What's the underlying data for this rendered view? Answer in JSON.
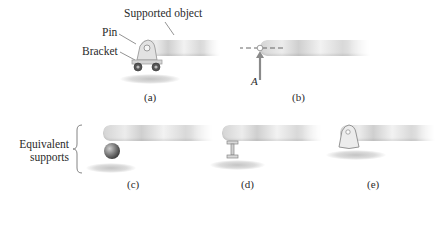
{
  "figure": {
    "panel_a": {
      "labels": {
        "supported_object": "Supported object",
        "pin": "Pin",
        "bracket": "Bracket"
      },
      "caption": "(a)"
    },
    "panel_b": {
      "force_label": "A",
      "caption": "(b)"
    },
    "group_label": {
      "line1": "Equivalent",
      "line2": "supports"
    },
    "panel_c": {
      "caption": "(c)"
    },
    "panel_d": {
      "caption": "(d)"
    },
    "panel_e": {
      "caption": "(e)"
    }
  },
  "colors": {
    "beam": "#dcdcdc",
    "arrow": "#8a8a8a",
    "text": "#2a2a2a"
  }
}
